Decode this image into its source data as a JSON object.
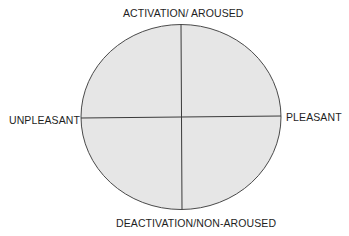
{
  "diagram": {
    "type": "circumplex",
    "labels": {
      "top": "ACTIVATION/ AROUSED",
      "bottom": "DEACTIVATION/NON-AROUSED",
      "left": "UNPLEASANT",
      "right": "PLEASANT"
    },
    "axes": {
      "vertical": {
        "from": "DEACTIVATION/NON-AROUSED",
        "to": "ACTIVATION/ AROUSED"
      },
      "horizontal": {
        "from": "UNPLEASANT",
        "to": "PLEASANT"
      }
    },
    "colors": {
      "fill": "#e6e6e6",
      "stroke": "#4a4a4a",
      "text": "#1e1e1e",
      "background": "#ffffff"
    }
  }
}
